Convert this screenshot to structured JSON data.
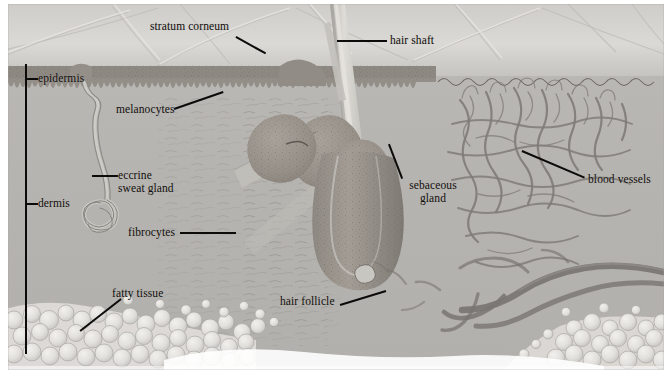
{
  "figure": {
    "kind": "anatomical-illustration",
    "orientation": "landscape",
    "width_px": 668,
    "height_px": 376,
    "palette": {
      "background_page": "#ffffff",
      "plate_base": "#b9b7b3",
      "dermis_fill": "#b5b3af",
      "epidermis_band": "#8e8a85",
      "stratum_corneum": "#d9d7d3",
      "hair_shaft": "#cfcdc8",
      "follicle_tissue": "#9a948d",
      "blood_vessel": "#7c7a77",
      "fat_globule": "#e6e4e0",
      "leader_line": "#0c0b0a",
      "label_text": "#100e0c"
    }
  },
  "labels": [
    {
      "id": "stratum-corneum",
      "text": "stratum corneum",
      "text_x": 150,
      "text_y": 22,
      "leader": {
        "x1": 236,
        "y1": 36,
        "x2": 265,
        "y2": 52
      },
      "lines": 1
    },
    {
      "id": "hair-shaft",
      "text": "hair shaft",
      "text_x": 390,
      "text_y": 33,
      "leader": {
        "x1": 386,
        "y1": 40,
        "x2": 337,
        "y2": 40
      },
      "lines": 1
    },
    {
      "id": "epidermis",
      "text": "epidermis",
      "text_x": 38,
      "text_y": 72,
      "leader": {
        "x1": 36,
        "y1": 78,
        "x2": 25,
        "y2": 78
      },
      "bracket": {
        "x": 25,
        "y": 64,
        "height": 30
      },
      "lines": 1
    },
    {
      "id": "melanocytes",
      "text": "melanocytes",
      "text_x": 117,
      "text_y": 105,
      "leader": {
        "x1": 175,
        "y1": 112,
        "x2": 224,
        "y2": 95
      },
      "lines": 1
    },
    {
      "id": "eccrine-sweat-gland",
      "text": "eccrine\nsweat gland",
      "text_line_1": "eccrine",
      "text_line_2": "sweat gland",
      "text_x": 119,
      "text_y": 172,
      "leader": {
        "x1": 117,
        "y1": 179,
        "x2": 92,
        "y2": 179
      },
      "lines": 2
    },
    {
      "id": "dermis",
      "text": "dermis",
      "text_x": 38,
      "text_y": 201,
      "leader": {
        "x1": 36,
        "y1": 207,
        "x2": 25,
        "y2": 207
      },
      "bracket": {
        "x": 25,
        "y": 80,
        "height": 270
      },
      "lines": 1
    },
    {
      "id": "fibrocytes",
      "text": "fibrocytes",
      "text_x": 128,
      "text_y": 229,
      "leader": {
        "x1": 180,
        "y1": 236,
        "x2": 232,
        "y2": 236
      },
      "lines": 1
    },
    {
      "id": "sebaceous-gland",
      "text": "sebaceous\ngland",
      "text_line_1": "sebaceous",
      "text_line_2": "gland",
      "text_x": 400,
      "text_y": 182,
      "leader": {
        "x1": 404,
        "y1": 180,
        "x2": 391,
        "y2": 146
      },
      "lines": 2
    },
    {
      "id": "blood-vessels",
      "text": "blood vessels",
      "text_x": 588,
      "text_y": 176,
      "leader": {
        "x1": 585,
        "y1": 180,
        "x2": 524,
        "y2": 152
      },
      "lines": 1
    },
    {
      "id": "fatty-tissue",
      "text": "fatty tissue",
      "text_x": 112,
      "text_y": 289,
      "leader": {
        "x1": 122,
        "y1": 298,
        "x2": 82,
        "y2": 330
      },
      "lines": 1
    },
    {
      "id": "hair-follicle",
      "text": "hair follicle",
      "text_x": 280,
      "text_y": 297,
      "leader": {
        "x1": 340,
        "y1": 304,
        "x2": 381,
        "y2": 291
      },
      "lines": 1
    }
  ],
  "structures": [
    {
      "id": "stratum-corneum-layer",
      "name": "stratum corneum",
      "region": "surface"
    },
    {
      "id": "epidermis-layer",
      "name": "epidermis",
      "region": "upper"
    },
    {
      "id": "dermis-layer",
      "name": "dermis",
      "region": "middle"
    },
    {
      "id": "subcutaneous-fat",
      "name": "fatty tissue",
      "region": "lower"
    },
    {
      "id": "hair-shaft-structure",
      "name": "hair shaft",
      "region": "center"
    },
    {
      "id": "hair-follicle-structure",
      "name": "hair follicle",
      "region": "center-lower"
    },
    {
      "id": "sebaceous-gland-structure",
      "name": "sebaceous gland",
      "region": "center"
    },
    {
      "id": "eccrine-gland-structure",
      "name": "eccrine sweat gland",
      "region": "left"
    },
    {
      "id": "capillary-network",
      "name": "blood vessels",
      "region": "right"
    },
    {
      "id": "fibrocyte-field",
      "name": "fibrocytes",
      "region": "left-middle"
    },
    {
      "id": "melanocyte-field",
      "name": "melanocytes",
      "region": "upper"
    }
  ]
}
